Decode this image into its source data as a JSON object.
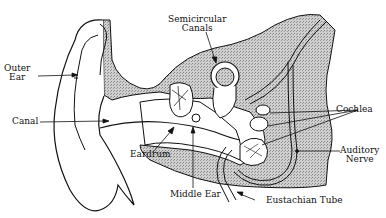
{
  "diagram": {
    "labels": {
      "outer_ear": [
        "Outer",
        "Ear"
      ],
      "canal": "Canal",
      "semicircular_canals": [
        "Semicircular",
        "Canals"
      ],
      "cochlea": "Cochlea",
      "auditory_nerve": [
        "Auditory",
        "Nerve"
      ],
      "eardrum": "Eardrum",
      "middle_ear": "Middle Ear",
      "eustachian_tube": "Eustachian Tube"
    },
    "colors": {
      "line": "#111111",
      "bone_shading": "#b8b8b8",
      "background": "#ffffff"
    }
  }
}
